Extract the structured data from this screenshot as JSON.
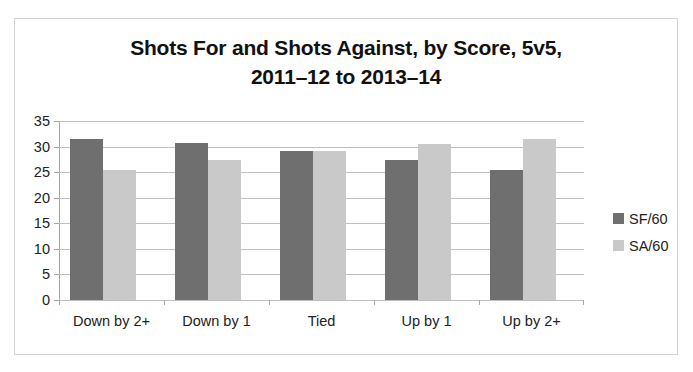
{
  "chart_data": {
    "type": "bar",
    "title": "Shots For and Shots Against, by Score, 5v5, 2011–12 to 2013–14",
    "title_lines": [
      "Shots For and Shots Against, by Score, 5v5,",
      "2011–12 to 2013–14"
    ],
    "xlabel": "",
    "ylabel": "",
    "categories": [
      "Down by 2+",
      "Down by 1",
      "Tied",
      "Up by 1",
      "Up by 2+"
    ],
    "series": [
      {
        "name": "SF/60",
        "color": "#6f6f6f",
        "values": [
          31.5,
          30.7,
          29.1,
          27.3,
          25.5
        ]
      },
      {
        "name": "SA/60",
        "color": "#c9c9c9",
        "values": [
          25.4,
          27.3,
          29.1,
          30.6,
          31.5
        ]
      }
    ],
    "ylim": [
      0,
      35
    ],
    "y_ticks": [
      0,
      5,
      10,
      15,
      20,
      25,
      30,
      35
    ],
    "y_tick_labels": [
      "0",
      "5",
      "10",
      "15",
      "20",
      "25",
      "30",
      "35"
    ],
    "grid": true,
    "legend_position": "right"
  },
  "legend": {
    "entries": [
      {
        "label": "SF/60"
      },
      {
        "label": "SA/60"
      }
    ]
  },
  "colors": {
    "series_sf": "#6f6f6f",
    "series_sa": "#c9c9c9",
    "gridline": "#bfbfbf",
    "axis": "#a6a6a6",
    "border": "#d4d4d4",
    "text": "#222222",
    "background": "#ffffff"
  }
}
